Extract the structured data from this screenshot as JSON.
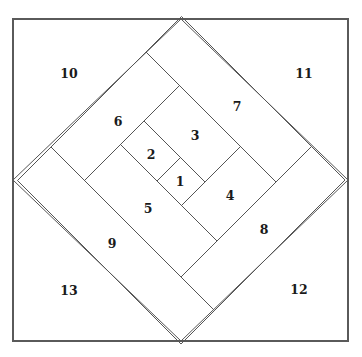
{
  "diagram": {
    "pieces": [
      {
        "id": "1",
        "label": "1"
      },
      {
        "id": "2",
        "label": "2"
      },
      {
        "id": "3",
        "label": "3"
      },
      {
        "id": "4",
        "label": "4"
      },
      {
        "id": "5",
        "label": "5"
      },
      {
        "id": "6",
        "label": "6"
      },
      {
        "id": "7",
        "label": "7"
      },
      {
        "id": "8",
        "label": "8"
      },
      {
        "id": "9",
        "label": "9"
      }
    ],
    "corners": [
      {
        "id": "10",
        "label": "10",
        "position": "top-left"
      },
      {
        "id": "11",
        "label": "11",
        "position": "top-right"
      },
      {
        "id": "12",
        "label": "12",
        "position": "bottom-right"
      },
      {
        "id": "13",
        "label": "13",
        "position": "bottom-left"
      }
    ],
    "colors": {
      "line": "#555555",
      "text": "#1a1a1a",
      "background": "#ffffff"
    }
  }
}
